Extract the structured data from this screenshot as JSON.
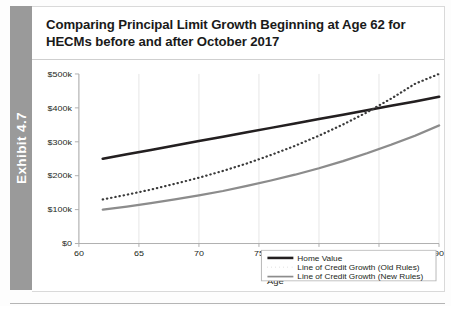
{
  "exhibit": {
    "label": "Exhibit 4.7"
  },
  "title": "Comparing Principal Limit Growth Beginning at Age 62 for HECMs before and after October 2017",
  "colors": {
    "home_value": "#231f20",
    "old_rules": "#3a3a3a",
    "new_rules": "#8c8c8c",
    "axis": "#a9a9a9",
    "grid": "#e4e4e4",
    "exhibit_tab": "#9a9a9a",
    "text": "#231f20"
  },
  "legend": {
    "items": [
      {
        "label": "Home Value",
        "style": "solid-thick-dark"
      },
      {
        "label": "Line of Credit Growth (Old Rules)",
        "style": "dotted-dark"
      },
      {
        "label": "Line of Credit Growth (New Rules)",
        "style": "solid-gray"
      }
    ]
  },
  "axes": {
    "x": {
      "label": "Age",
      "ticks": [
        "60",
        "65",
        "70",
        "75",
        "80",
        "85",
        "90"
      ],
      "min": 60,
      "max": 90
    },
    "y": {
      "label": "",
      "ticks": [
        "$0",
        "$100k",
        "$200k",
        "$300k",
        "$400k",
        "$500k"
      ],
      "min": 0,
      "max": 500000
    }
  },
  "chart_data": {
    "type": "line",
    "title": "Comparing Principal Limit Growth Beginning at Age 62 for HECMs before and after October 2017",
    "xlabel": "Age",
    "ylabel": "",
    "xlim": [
      60,
      90
    ],
    "ylim": [
      0,
      500000
    ],
    "grid": true,
    "legend_position": "bottom-right",
    "x": [
      62,
      64,
      66,
      68,
      70,
      72,
      74,
      76,
      78,
      80,
      82,
      84,
      86,
      88,
      90
    ],
    "series": [
      {
        "name": "Home Value",
        "style": "solid",
        "color": "#231f20",
        "width": 3,
        "values": [
          250000,
          263000,
          276000,
          289000,
          302000,
          315000,
          328000,
          341000,
          354000,
          367000,
          380000,
          393000,
          406000,
          419000,
          433000
        ]
      },
      {
        "name": "Line of Credit Growth (Old Rules)",
        "style": "dotted",
        "color": "#3a3a3a",
        "width": 2.6,
        "values": [
          130000,
          144000,
          159000,
          176000,
          194000,
          214000,
          236000,
          261000,
          288000,
          318000,
          351000,
          387000,
          427000,
          471000,
          500000
        ]
      },
      {
        "name": "Line of Credit Growth (New Rules)",
        "style": "solid",
        "color": "#8c8c8c",
        "width": 2.6,
        "values": [
          100000,
          109000,
          119000,
          130000,
          142000,
          155000,
          170000,
          186000,
          203000,
          222000,
          243000,
          266000,
          291000,
          318000,
          348000
        ]
      }
    ],
    "annotations": [
      {
        "text": "Old Rules line crosses Home Value near age 83"
      }
    ]
  }
}
